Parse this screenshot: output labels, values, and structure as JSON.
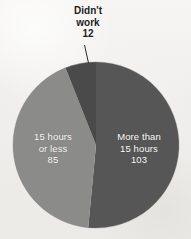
{
  "chart_data": {
    "type": "pie",
    "title": "",
    "subtitle": "",
    "xlabel": "",
    "ylabel": "",
    "legend_position": "none",
    "grid": false,
    "total": 200,
    "units": "respondents",
    "categories": [
      "More than 15 hours",
      "15 hours or less",
      "Didn't work"
    ],
    "values": [
      103,
      85,
      12
    ],
    "slices": [
      {
        "label": "More than 15 hours",
        "label_lines": [
          "More than",
          "15 hours"
        ],
        "value": 103,
        "value_text": "103",
        "percent": 51.5,
        "color": "#565656",
        "label_placement": "inside",
        "start_angle_deg": 0,
        "end_angle_deg": 185.4
      },
      {
        "label": "15 hours or less",
        "label_lines": [
          "15 hours",
          "or less"
        ],
        "value": 85,
        "value_text": "85",
        "percent": 42.5,
        "color": "#8b8b89",
        "label_placement": "inside",
        "start_angle_deg": 185.4,
        "end_angle_deg": 338.4
      },
      {
        "label": "Didn't work",
        "label_lines": [
          "Didn't",
          "work"
        ],
        "value": 12,
        "value_text": "12",
        "percent": 6.0,
        "color": "#4a4a4a",
        "label_placement": "outside-callout",
        "start_angle_deg": 338.4,
        "end_angle_deg": 360
      }
    ]
  },
  "pie": {
    "center_x": 96,
    "center_y": 145,
    "radius": 83,
    "background_color": "#f2f1ef"
  },
  "labels": {
    "left_slice": {
      "line1": "15 hours",
      "line2": "or less",
      "line3": "85"
    },
    "right_slice": {
      "line1": "More than",
      "line2": "15 hours",
      "line3": "103"
    },
    "callout": {
      "line1": "Didn't",
      "line2": "work",
      "line3": "12"
    }
  }
}
